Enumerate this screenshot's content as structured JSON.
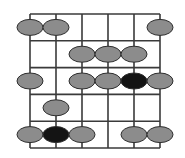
{
  "diagram": {
    "type": "guitar-scale-fretboard",
    "strings": 6,
    "frets": 5,
    "colors": {
      "line": "#3a3a3a",
      "note": "#8c8c8c",
      "root": "#141414",
      "note_stroke": "#2e2e2e",
      "background": "#ffffff"
    },
    "geometry": {
      "left": 30,
      "right": 160,
      "top": 14,
      "bottom": 148,
      "string_spacing": 26,
      "fret_spacing": 26.8,
      "note_rx": 13,
      "note_ry": 8
    },
    "notes": [
      {
        "fret": 1,
        "string": 1,
        "root": false
      },
      {
        "fret": 1,
        "string": 2,
        "root": false
      },
      {
        "fret": 1,
        "string": 6,
        "root": false
      },
      {
        "fret": 2,
        "string": 3,
        "root": false
      },
      {
        "fret": 2,
        "string": 4,
        "root": false
      },
      {
        "fret": 2,
        "string": 5,
        "root": false
      },
      {
        "fret": 3,
        "string": 1,
        "root": false
      },
      {
        "fret": 3,
        "string": 3,
        "root": false
      },
      {
        "fret": 3,
        "string": 4,
        "root": false
      },
      {
        "fret": 3,
        "string": 5,
        "root": true
      },
      {
        "fret": 3,
        "string": 6,
        "root": false
      },
      {
        "fret": 4,
        "string": 2,
        "root": false
      },
      {
        "fret": 5,
        "string": 1,
        "root": false
      },
      {
        "fret": 5,
        "string": 2,
        "root": true
      },
      {
        "fret": 5,
        "string": 3,
        "root": false
      },
      {
        "fret": 5,
        "string": 5,
        "root": false
      },
      {
        "fret": 5,
        "string": 6,
        "root": false
      }
    ]
  }
}
